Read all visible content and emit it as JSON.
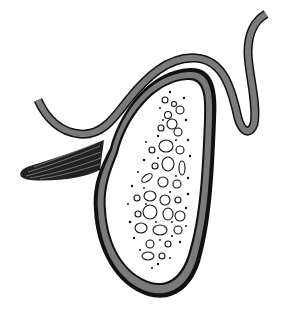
{
  "illustration": {
    "subject": "gallbladder with gallstones",
    "colors": {
      "background": "#ffffff",
      "outline": "#111111",
      "wall_fill": "#7a7a7a",
      "lumen": "#ffffff"
    }
  }
}
